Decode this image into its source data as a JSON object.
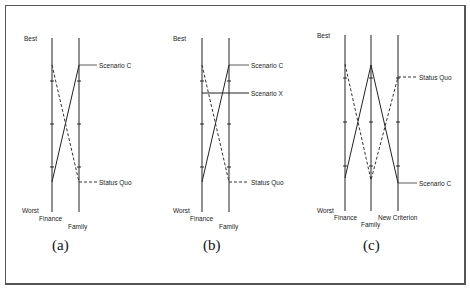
{
  "figure": {
    "panels": [
      {
        "caption": "(a)",
        "top_label": "Best",
        "bottom_label": "Worst",
        "axes": [
          "Finance",
          "Family"
        ],
        "series": [
          {
            "name": "Scenario C",
            "style": "solid",
            "values": [
              0.2,
              0.85
            ]
          },
          {
            "name": "Status Quo",
            "style": "dashed",
            "values": [
              0.85,
              0.2
            ]
          }
        ]
      },
      {
        "caption": "(b)",
        "top_label": "Best",
        "bottom_label": "Worst",
        "axes": [
          "Finance",
          "Family"
        ],
        "series": [
          {
            "name": "Scenario C",
            "style": "solid",
            "values": [
              0.2,
              0.85
            ]
          },
          {
            "name": "Scenario X",
            "style": "solid",
            "values": [
              0.7,
              0.7
            ]
          },
          {
            "name": "Status Quo",
            "style": "dashed",
            "values": [
              0.85,
              0.2
            ]
          }
        ]
      },
      {
        "caption": "(c)",
        "top_label": "Best",
        "bottom_label": "Worst",
        "axes": [
          "Finance",
          "Family",
          "New Criterion"
        ],
        "series": [
          {
            "name": "Status Quo",
            "style": "dashed",
            "values": [
              0.85,
              0.2,
              0.78
            ]
          },
          {
            "name": "Scenario C",
            "style": "solid",
            "values": [
              0.2,
              0.85,
              0.18
            ]
          }
        ]
      }
    ]
  }
}
